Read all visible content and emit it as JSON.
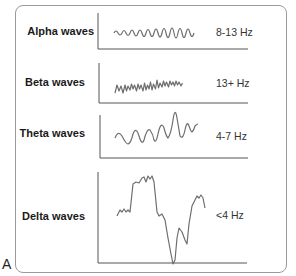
{
  "figure": {
    "panel_label": "A",
    "rows": [
      {
        "name": "Alpha waves",
        "frequency": "8-13 Hz"
      },
      {
        "name": "Beta waves",
        "frequency": "13+ Hz"
      },
      {
        "name": "Theta waves",
        "frequency": "4-7 Hz"
      },
      {
        "name": "Delta waves",
        "frequency": "<4 Hz"
      }
    ],
    "colors": {
      "wave": "#6e6e6e",
      "axis": "#555555",
      "frame": "#9a9a9a"
    }
  }
}
